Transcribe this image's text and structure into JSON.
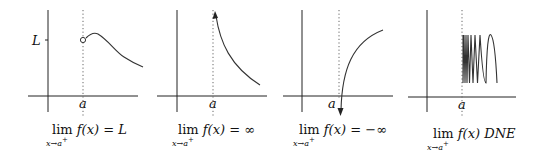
{
  "figure": {
    "panels": [
      {
        "id": "finite-limit",
        "y_label": "L",
        "x_label": "a",
        "caption": {
          "lim": "lim",
          "sub": "x→a",
          "sup": "+",
          "expr": "f(x) = L"
        },
        "description": "Function approaching L from the right of a, open circle at (a, L)"
      },
      {
        "id": "infinite-limit",
        "x_label": "a",
        "caption": {
          "lim": "lim",
          "sub": "x→a",
          "sup": "+",
          "expr": "f(x) = ∞"
        },
        "description": "Curve rising toward vertical asymptote at a with upward arrow"
      },
      {
        "id": "negative-infinite-limit",
        "x_label": "a",
        "caption": {
          "lim": "lim",
          "sub": "x→a",
          "sup": "+",
          "expr": "f(x) = −∞"
        },
        "description": "Curve falling toward vertical asymptote at a with downward arrow"
      },
      {
        "id": "dne-limit",
        "x_label": "a",
        "caption": {
          "lim": "lim",
          "sub": "x→a",
          "sup": "+",
          "expr": "f(x) DNE"
        },
        "description": "Function oscillating increasingly fast as x approaches a from the right"
      }
    ]
  }
}
